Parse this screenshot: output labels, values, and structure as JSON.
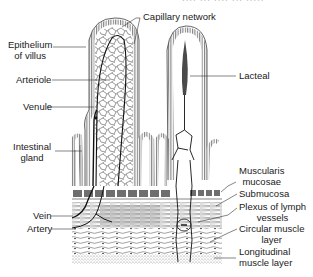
{
  "header_fragment": "···· ··· ···· ··· ·····",
  "diagram": {
    "labels_left": [
      {
        "id": "epithelium",
        "text1": "Epithelium",
        "text2": "of villus"
      },
      {
        "id": "arteriole",
        "text1": "Arteriole"
      },
      {
        "id": "venule",
        "text1": "Venule"
      },
      {
        "id": "intestinal-gland",
        "text1": "Intestinal",
        "text2": "gland"
      },
      {
        "id": "vein",
        "text1": "Vein"
      },
      {
        "id": "artery",
        "text1": "Artery"
      }
    ],
    "labels_top": [
      {
        "id": "capillary-network",
        "text1": "Capillary network"
      }
    ],
    "labels_right": [
      {
        "id": "lacteal",
        "text1": "Lacteal"
      },
      {
        "id": "muscularis-mucosae",
        "text1": "Muscularis",
        "text2": "mucosae"
      },
      {
        "id": "submucosa",
        "text1": "Submucosa"
      },
      {
        "id": "plexus",
        "text1": "Plexus of lymph",
        "text2": "vessels"
      },
      {
        "id": "circular-muscle",
        "text1": "Circular muscle",
        "text2": "layer"
      },
      {
        "id": "longitudinal-muscle",
        "text1": "Longitudinal",
        "text2": "muscle layer"
      }
    ]
  },
  "colors": {
    "ink": "#1a1a1a",
    "layer_gray": "#6e6e6e",
    "stipple": "#bdbdbd",
    "background": "#ffffff"
  }
}
